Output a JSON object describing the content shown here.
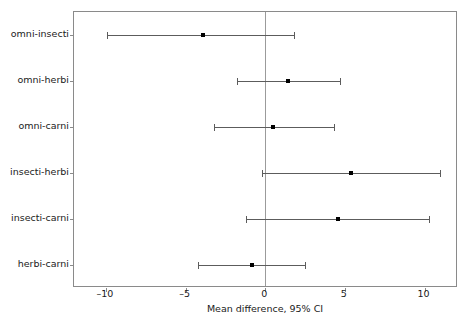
{
  "chart_data": {
    "type": "scatter",
    "subtype": "forest-plot",
    "title": "",
    "xlabel": "Mean difference, 95% CI",
    "ylabel": "",
    "xlim": [
      -12,
      12.1
    ],
    "xticks": [
      -10,
      -5,
      0,
      5,
      10
    ],
    "xticklabels": [
      "–10",
      "–5",
      "0",
      "5",
      "10"
    ],
    "grid": false,
    "legend": null,
    "reference_line": 0,
    "categories": [
      "omni-insecti",
      "omni-herbi",
      "omni-carni",
      "insecti-herbi",
      "insecti-carni",
      "herbi-carni"
    ],
    "points": [
      {
        "label": "omni-insecti",
        "estimate": -3.9,
        "ci_low": -9.9,
        "ci_high": 1.8
      },
      {
        "label": "omni-herbi",
        "estimate": 1.4,
        "ci_low": -1.8,
        "ci_high": 4.7
      },
      {
        "label": "omni-carni",
        "estimate": 0.5,
        "ci_low": -3.2,
        "ci_high": 4.3
      },
      {
        "label": "insecti-herbi",
        "estimate": 5.4,
        "ci_low": -0.2,
        "ci_high": 11.0
      },
      {
        "label": "insecti-carni",
        "estimate": 4.6,
        "ci_low": -1.2,
        "ci_high": 10.3
      },
      {
        "label": "herbi-carni",
        "estimate": -0.8,
        "ci_low": -4.2,
        "ci_high": 2.5
      }
    ]
  },
  "colors": {
    "frame": "#8a8a8a",
    "reference_line": "#9b9b9b",
    "ci": "#5c5c5c",
    "marker": "#000000",
    "text": "#1a1a1a",
    "background": "#ffffff"
  }
}
